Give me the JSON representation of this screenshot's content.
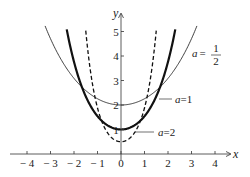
{
  "chart_data": {
    "type": "line",
    "title": "",
    "xlabel": "x",
    "ylabel": "y",
    "xlim": [
      -4.4,
      4.5
    ],
    "ylim": [
      -0.3,
      5.5
    ],
    "x_ticks": [
      -4,
      -3,
      -2,
      -1,
      0,
      1,
      2,
      3,
      4
    ],
    "x_tick_labels": [
      "− 4",
      "− 3",
      "− 2",
      "− 1",
      "0",
      "1",
      "2",
      "3",
      "4"
    ],
    "y_ticks": [
      1,
      2,
      3,
      4,
      5
    ],
    "y_tick_labels": [
      "1",
      "2",
      "3",
      "4",
      "5"
    ],
    "grid": false,
    "legend": "inline annotations",
    "series": [
      {
        "name": "a = 1/2",
        "function": "y = 2 cosh(x/2)",
        "style": "thin solid",
        "minimum": [
          0,
          2
        ],
        "x": [
          -3.2,
          -2,
          -1,
          0,
          1,
          2,
          3.2
        ],
        "values": [
          5.15,
          3.09,
          2.26,
          2.0,
          2.26,
          3.09,
          5.15
        ]
      },
      {
        "name": "a = 1",
        "function": "y = cosh(x)",
        "style": "thick solid",
        "minimum": [
          0,
          1
        ],
        "x": [
          -2.3,
          -2,
          -1,
          0,
          1,
          2,
          2.3
        ],
        "values": [
          5.04,
          3.76,
          1.54,
          1.0,
          1.54,
          3.76,
          5.04
        ]
      },
      {
        "name": "a = 2",
        "function": "y = 0.5 cosh(2x)",
        "style": "dashed",
        "minimum": [
          0,
          0.5
        ],
        "x": [
          -1.5,
          -1,
          -0.5,
          0,
          0.5,
          1,
          1.5
        ],
        "values": [
          5.03,
          1.88,
          0.77,
          0.5,
          0.77,
          1.88,
          5.03
        ]
      }
    ],
    "annotations": [
      {
        "text": "a = 1/2",
        "a": "a",
        "eq": "=",
        "num": "1",
        "den": "2"
      },
      {
        "text": "a = 1",
        "a": "a",
        "eq": "=",
        "val": "1"
      },
      {
        "text": "a = 2",
        "a": "a",
        "eq": "=",
        "val": "2"
      }
    ]
  }
}
